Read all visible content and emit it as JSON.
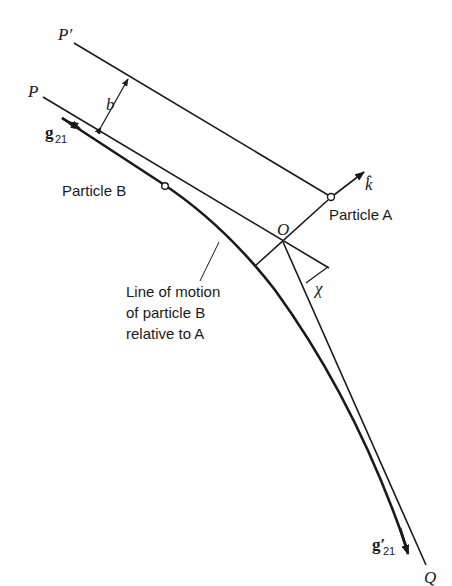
{
  "figure": {
    "labels": {
      "p_prime": "P′",
      "p": "P",
      "b": "b",
      "g21": "g",
      "g21_sub": "21",
      "g21_prime": "g′",
      "g21_prime_sub": "21",
      "particle_b": "Particle  B",
      "particle_a": "Particle  A",
      "o": "O",
      "k_hat": "k̂",
      "chi": "χ",
      "q": "Q",
      "annotation_line1": "Line of motion",
      "annotation_line2": "of particle B",
      "annotation_line3": "relative to A"
    },
    "colors": {
      "ink": "#1a1a1a",
      "background": "#ffffff"
    }
  }
}
